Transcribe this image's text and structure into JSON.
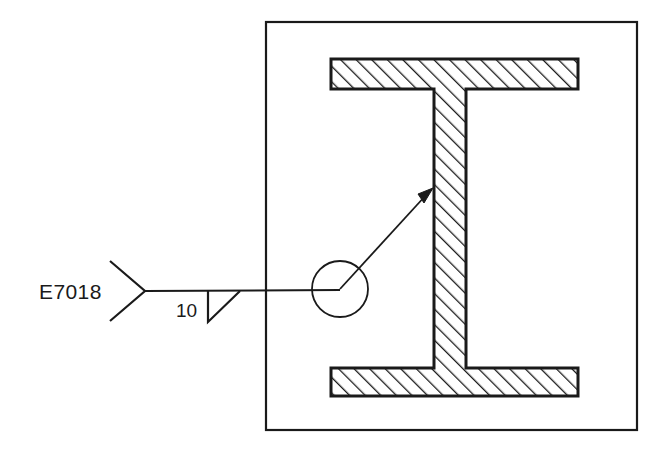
{
  "drawing": {
    "title": "Fillet weld symbol applied to I-beam web",
    "background_color": "#ffffff",
    "line_color": "#1a1a1a",
    "hatch_color": "#1a1a1a"
  },
  "annotations": {
    "electrode_label": "E7018",
    "weld_size_label": "10",
    "weld_symbol_type": "fillet-weld-triangle",
    "tail_type": "open-fork-tail",
    "leader_arrow_target": "beam-web"
  },
  "geometry": {
    "border": {
      "x": 266,
      "y": 22,
      "width": 371,
      "height": 408
    },
    "top_flange": {
      "x": 331,
      "y": 59,
      "width": 247,
      "height": 30
    },
    "bottom_flange": {
      "x": 331,
      "y": 368,
      "width": 247,
      "height": 28
    },
    "web": {
      "x": 434,
      "y": 89,
      "width": 32,
      "height": 279
    },
    "detail_circle": {
      "cx": 340,
      "cy": 289,
      "r": 28
    },
    "reference_line": {
      "x1": 145,
      "y1": 291,
      "x2": 340,
      "y2": 291
    },
    "tail_vertex": {
      "x": 145,
      "y": 291
    },
    "tail_upper_end": {
      "x": 110,
      "y": 261
    },
    "tail_lower_end": {
      "x": 110,
      "y": 321
    },
    "weld_triangle": {
      "vertical_x": 208,
      "top_y": 291,
      "bottom_y": 322,
      "hypotenuse_end_x": 240
    },
    "leader_arrow": {
      "x1": 340,
      "y1": 289,
      "x2": 432,
      "y2": 189
    },
    "hatch_angle_deg": 45,
    "hatch_spacing_px": 11
  }
}
